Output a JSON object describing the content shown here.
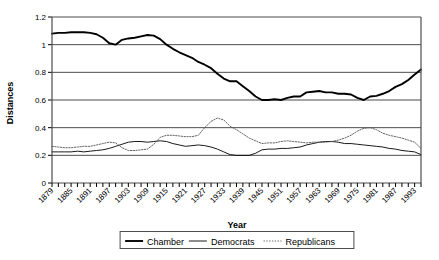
{
  "chart_data": {
    "type": "line",
    "title": "",
    "xlabel": "Year",
    "ylabel": "Distances",
    "ylim": [
      0,
      1.2
    ],
    "ytick_step": 0.2,
    "yticks": [
      "0",
      "0.2",
      "0.4",
      "0.6",
      "0.8",
      "1",
      "1.2"
    ],
    "xlim": [
      1879,
      1997
    ],
    "xtick_step": 2,
    "xlabel_step": 6,
    "grid": "horizontal",
    "legend_position": "bottom",
    "tick_labels_rotated": true,
    "categories": [
      1879,
      1881,
      1883,
      1885,
      1887,
      1889,
      1891,
      1893,
      1895,
      1897,
      1899,
      1901,
      1903,
      1905,
      1907,
      1909,
      1911,
      1913,
      1915,
      1917,
      1919,
      1921,
      1923,
      1925,
      1927,
      1929,
      1931,
      1933,
      1935,
      1937,
      1939,
      1941,
      1943,
      1945,
      1947,
      1949,
      1951,
      1953,
      1955,
      1957,
      1959,
      1961,
      1963,
      1965,
      1967,
      1969,
      1971,
      1973,
      1975,
      1977,
      1979,
      1981,
      1983,
      1985,
      1987,
      1989,
      1991,
      1993,
      1995
    ],
    "xtick_labels": [
      "1879",
      "1885",
      "1891",
      "1897",
      "1903",
      "1909",
      "1915",
      "1921",
      "1927",
      "1933",
      "1939",
      "1945",
      "1951",
      "1957",
      "1963",
      "1969",
      "1975",
      "1981",
      "1987",
      "1993"
    ],
    "series": [
      {
        "name": "Chamber",
        "style": "thick-solid",
        "color": "#000000",
        "values": [
          1.08,
          1.085,
          1.085,
          1.09,
          1.09,
          1.09,
          1.085,
          1.075,
          1.05,
          1.01,
          1.0,
          1.035,
          1.045,
          1.05,
          1.06,
          1.07,
          1.065,
          1.04,
          1.0,
          0.97,
          0.945,
          0.925,
          0.905,
          0.875,
          0.855,
          0.83,
          0.79,
          0.755,
          0.735,
          0.735,
          0.7,
          0.665,
          0.625,
          0.6,
          0.6,
          0.605,
          0.6,
          0.615,
          0.625,
          0.625,
          0.655,
          0.66,
          0.665,
          0.655,
          0.655,
          0.645,
          0.645,
          0.64,
          0.615,
          0.6,
          0.625,
          0.63,
          0.645,
          0.665,
          0.695,
          0.715,
          0.745,
          0.785,
          0.82
        ]
      },
      {
        "name": "Democrats",
        "style": "thin-solid",
        "color": "#000000",
        "values": [
          0.225,
          0.225,
          0.225,
          0.225,
          0.23,
          0.225,
          0.23,
          0.235,
          0.24,
          0.25,
          0.265,
          0.28,
          0.295,
          0.3,
          0.3,
          0.295,
          0.3,
          0.305,
          0.3,
          0.285,
          0.275,
          0.265,
          0.27,
          0.275,
          0.27,
          0.26,
          0.245,
          0.225,
          0.205,
          0.2,
          0.2,
          0.2,
          0.215,
          0.24,
          0.245,
          0.245,
          0.25,
          0.25,
          0.255,
          0.26,
          0.275,
          0.285,
          0.295,
          0.3,
          0.3,
          0.295,
          0.285,
          0.285,
          0.28,
          0.275,
          0.27,
          0.265,
          0.26,
          0.25,
          0.245,
          0.235,
          0.23,
          0.225,
          0.205
        ]
      },
      {
        "name": "Republicans",
        "style": "dotted",
        "color": "#555555",
        "values": [
          0.265,
          0.26,
          0.255,
          0.255,
          0.26,
          0.265,
          0.265,
          0.275,
          0.285,
          0.295,
          0.29,
          0.255,
          0.235,
          0.235,
          0.24,
          0.245,
          0.28,
          0.33,
          0.345,
          0.345,
          0.34,
          0.335,
          0.335,
          0.345,
          0.4,
          0.445,
          0.47,
          0.455,
          0.41,
          0.385,
          0.355,
          0.325,
          0.305,
          0.285,
          0.29,
          0.29,
          0.3,
          0.305,
          0.3,
          0.295,
          0.29,
          0.295,
          0.295,
          0.295,
          0.3,
          0.31,
          0.325,
          0.345,
          0.375,
          0.395,
          0.4,
          0.385,
          0.36,
          0.345,
          0.335,
          0.325,
          0.31,
          0.295,
          0.25
        ]
      }
    ],
    "legend": [
      {
        "label": "Chamber",
        "style": "thick-solid"
      },
      {
        "label": "Democrats",
        "style": "thin-solid"
      },
      {
        "label": "Republicans",
        "style": "dotted"
      }
    ]
  }
}
